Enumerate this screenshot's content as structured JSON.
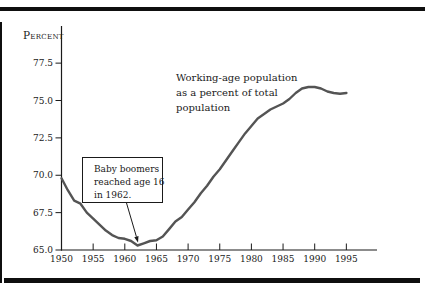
{
  "figure": {
    "background": "#ffffff",
    "rule_color": "#0f0f0f",
    "axis_color": "#1a1a1a",
    "line_color": "#545454"
  },
  "chart_data": {
    "type": "line",
    "title": "",
    "xlabel": "",
    "ylabel": "Percent",
    "xlim": [
      1950,
      1999
    ],
    "ylim": [
      65.0,
      78.8
    ],
    "grid": false,
    "legend_position": "none",
    "y_ticks": [
      {
        "value": 77.5,
        "label": "77.5"
      },
      {
        "value": 75.0,
        "label": "75.0"
      },
      {
        "value": 72.5,
        "label": "72.5"
      },
      {
        "value": 70.0,
        "label": "70.0"
      },
      {
        "value": 67.5,
        "label": "67.5"
      },
      {
        "value": 65.0,
        "label": "65.0"
      }
    ],
    "x_ticks": [
      {
        "year": 1950,
        "label": "1950",
        "mark": false
      },
      {
        "year": 1955,
        "label": "1955",
        "mark": true
      },
      {
        "year": 1960,
        "label": "1960",
        "mark": true
      },
      {
        "year": 1965,
        "label": "1965",
        "mark": true
      },
      {
        "year": 1970,
        "label": "1970",
        "mark": true
      },
      {
        "year": 1975,
        "label": "1975",
        "mark": true
      },
      {
        "year": 1980,
        "label": "1980",
        "mark": true
      },
      {
        "year": 1985,
        "label": "1985",
        "mark": true
      },
      {
        "year": 1990,
        "label": "1990",
        "mark": true
      },
      {
        "year": 1995,
        "label": "1995",
        "mark": true
      }
    ],
    "series": [
      {
        "name": "Working-age population as a percent of total population",
        "color": "#545454",
        "x": [
          1950,
          1951,
          1952,
          1953,
          1954,
          1955,
          1956,
          1957,
          1958,
          1959,
          1960,
          1961,
          1962,
          1963,
          1964,
          1965,
          1966,
          1967,
          1968,
          1969,
          1970,
          1971,
          1972,
          1973,
          1974,
          1975,
          1976,
          1977,
          1978,
          1979,
          1980,
          1981,
          1982,
          1983,
          1984,
          1985,
          1986,
          1987,
          1988,
          1989,
          1990,
          1991,
          1992,
          1993,
          1994,
          1995
        ],
        "values": [
          69.8,
          69.0,
          68.3,
          68.1,
          67.5,
          67.1,
          66.7,
          66.3,
          66.0,
          65.8,
          65.75,
          65.6,
          65.3,
          65.45,
          65.6,
          65.65,
          65.9,
          66.4,
          66.9,
          67.2,
          67.7,
          68.2,
          68.8,
          69.3,
          69.9,
          70.4,
          71.0,
          71.6,
          72.2,
          72.8,
          73.3,
          73.8,
          74.1,
          74.4,
          74.6,
          74.8,
          75.1,
          75.5,
          75.8,
          75.9,
          75.9,
          75.8,
          75.6,
          75.5,
          75.45,
          75.5
        ]
      }
    ],
    "annotations": {
      "series_label": {
        "lines": [
          "Working-age population",
          "as a percent of total",
          "population"
        ]
      },
      "callout": {
        "lines": [
          "Baby boomers",
          "reached age 16",
          "in 1962."
        ],
        "target_year": 1962,
        "target_value": 65.3
      }
    }
  }
}
